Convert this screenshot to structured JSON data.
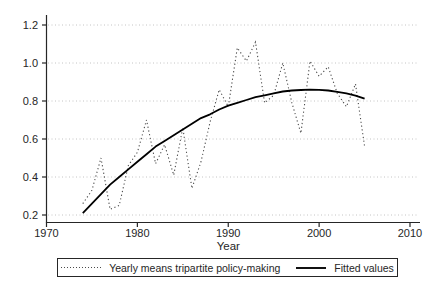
{
  "chart_data": {
    "type": "line",
    "title": "",
    "xlabel": "Year",
    "ylabel": "",
    "xlim": [
      1970,
      2010
    ],
    "ylim": [
      0.2,
      1.2
    ],
    "x_tick_labels": [
      "1970",
      "1980",
      "1990",
      "2000",
      "2010"
    ],
    "y_tick_labels": [
      "1.2",
      "1.0",
      "0.8",
      "0.6",
      "0.4",
      "0.2"
    ],
    "grid": "horizontal-dotted",
    "gridline_color": "#c4c4c4",
    "axis_color": "#262626",
    "legend_position": "bottom-outside-boxed",
    "x": [
      1974,
      1975,
      1976,
      1977,
      1978,
      1979,
      1980,
      1981,
      1982,
      1983,
      1984,
      1985,
      1986,
      1987,
      1988,
      1989,
      1990,
      1991,
      1992,
      1993,
      1994,
      1995,
      1996,
      1997,
      1998,
      1999,
      2000,
      2001,
      2002,
      2003,
      2004,
      2005
    ],
    "series": [
      {
        "name": "Yearly means tripartite policy-making",
        "style": "dotted",
        "color": "#4a4a4a",
        "values": [
          0.26,
          0.33,
          0.5,
          0.23,
          0.25,
          0.46,
          0.53,
          0.7,
          0.47,
          0.57,
          0.41,
          0.66,
          0.34,
          0.48,
          0.69,
          0.86,
          0.77,
          1.08,
          1.01,
          1.11,
          0.79,
          0.83,
          1.0,
          0.79,
          0.63,
          1.01,
          0.93,
          0.98,
          0.84,
          0.77,
          0.89,
          0.56
        ]
      },
      {
        "name": "Fitted values",
        "style": "solid",
        "color": "#000000",
        "values": [
          0.21,
          0.26,
          0.31,
          0.36,
          0.4,
          0.44,
          0.48,
          0.52,
          0.56,
          0.59,
          0.62,
          0.65,
          0.68,
          0.71,
          0.73,
          0.755,
          0.775,
          0.79,
          0.805,
          0.82,
          0.83,
          0.84,
          0.85,
          0.855,
          0.858,
          0.86,
          0.859,
          0.855,
          0.848,
          0.84,
          0.828,
          0.812
        ]
      }
    ]
  }
}
